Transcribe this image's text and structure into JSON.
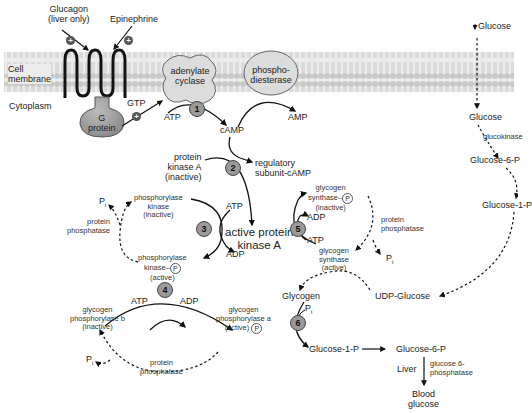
{
  "membrane": {
    "cell_membrane_label": [
      "Cell",
      "membrane"
    ],
    "cytoplasm_label": "Cytoplasm"
  },
  "hormones": {
    "glucagon": [
      "Glucagon",
      "(liver only)"
    ],
    "epinephrine": "Epinephrine",
    "stimulation_symbol": "+"
  },
  "receptor": {
    "g_protein": [
      "G",
      "protein"
    ],
    "gtp": "GTP"
  },
  "enzymes": {
    "adenylate_cyclase": [
      "adenylate",
      "cyclase"
    ],
    "phosphodiesterase": [
      "phospho-",
      "diesterase"
    ]
  },
  "camp_pathway": {
    "atp": "ATP",
    "camp": "cAMP",
    "amp": "AMP",
    "pka_inactive": [
      "protein",
      "kinase A",
      "(inactive)"
    ],
    "regulatory": [
      "regulatory",
      "subunit-cAMP"
    ],
    "pka_active": [
      "active protein",
      "kinase A"
    ]
  },
  "steps": [
    "1",
    "2",
    "3",
    "4",
    "5",
    "6"
  ],
  "phosphorylase_kinase": {
    "inactive": [
      "phosphorylase",
      "kinase",
      "(inactive)"
    ],
    "active": [
      "phosphorylase",
      "kinase–",
      "(active)"
    ],
    "atp": "ATP",
    "adp": "ADP",
    "pi": "P",
    "pi_sub": "i",
    "phosphatase": [
      "protein",
      "phosphatase"
    ]
  },
  "glycogen_phosphorylase": {
    "b_inactive": [
      "glycogen",
      "phosphorylase b",
      "(inactive)"
    ],
    "a_active": [
      "glycogen",
      "phosphorylase a",
      "(active)"
    ],
    "atp": "ATP",
    "adp": "ADP",
    "pi": "P",
    "pi_sub": "i",
    "phosphatase": [
      "protein",
      "phosphatase"
    ]
  },
  "glycogen_synthase": {
    "inactive": [
      "glycogen",
      "synthase–",
      "(inactive)"
    ],
    "active": [
      "glycogen",
      "synthase",
      "(active)"
    ],
    "adp": "ADP",
    "atp": "ATP",
    "pi": "P",
    "pi_sub": "i",
    "phosphatase": [
      "protein",
      "phosphatase"
    ]
  },
  "phosphate_tag": "P",
  "glucose_pathway": {
    "glucose_in": "Glucose",
    "glucose": "Glucose",
    "glucokinase": "glucokinase",
    "g6p": "Glucose-6-P",
    "g1p": "Glucose-1-P",
    "udp_glucose": "UDP-Glucose",
    "glycogen": "Glycogen",
    "pi": "P",
    "pi_sub": "i",
    "g1p_bottom": "Glucose-1-P",
    "g6p_bottom": "Glucose-6-P",
    "liver": "Liver",
    "g6pase": [
      "glucose 6-",
      "phosphatase"
    ],
    "blood_glucose": [
      "Blood",
      "glucose"
    ]
  }
}
